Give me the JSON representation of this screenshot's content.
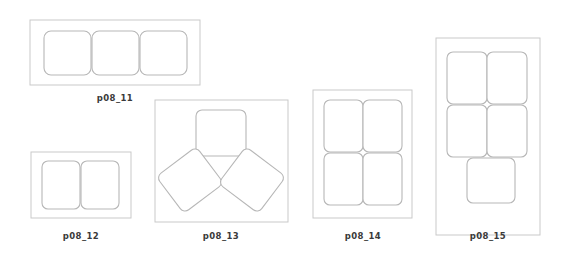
{
  "page": {
    "background_color": "#ffffff",
    "width": 574,
    "height": 255
  },
  "style": {
    "frame_stroke_color": "#c9c9c9",
    "piece_stroke_color": "#b7b7b7",
    "piece_fill_color": "#ffffff",
    "caption_color": "#3a3a3a"
  },
  "figures": [
    {
      "id": "p08_11",
      "label": "p08_11",
      "caption_x": 115,
      "caption_y": 101,
      "frame": {
        "x": 30,
        "y": 20,
        "w": 170,
        "h": 65
      },
      "piece_count": 3,
      "arrangement": "row-of-3",
      "pieces": [
        {
          "x": 44,
          "y": 31,
          "w": 47,
          "h": 44,
          "r": 7,
          "rotate": 0
        },
        {
          "x": 92,
          "y": 31,
          "w": 47,
          "h": 44,
          "r": 7,
          "rotate": 0
        },
        {
          "x": 140,
          "y": 31,
          "w": 47,
          "h": 44,
          "r": 7,
          "rotate": 0
        }
      ]
    },
    {
      "id": "p08_12",
      "label": "p08_12",
      "caption_x": 81,
      "caption_y": 239,
      "frame": {
        "x": 31,
        "y": 152,
        "w": 100,
        "h": 66
      },
      "piece_count": 2,
      "arrangement": "row-of-2",
      "pieces": [
        {
          "x": 42,
          "y": 161,
          "w": 38,
          "h": 48,
          "r": 6,
          "rotate": 0
        },
        {
          "x": 81,
          "y": 161,
          "w": 38,
          "h": 48,
          "r": 6,
          "rotate": 0
        }
      ]
    },
    {
      "id": "p08_13",
      "label": "p08_13",
      "caption_x": 221,
      "caption_y": 239,
      "frame": {
        "x": 155,
        "y": 100,
        "w": 133,
        "h": 122
      },
      "piece_count": 3,
      "arrangement": "fan-of-3",
      "pieces": [
        {
          "x": 196,
          "y": 110,
          "w": 50,
          "h": 46,
          "r": 6,
          "rotate": 0,
          "cx": 221,
          "cy": 133
        },
        {
          "x": 165,
          "y": 157,
          "w": 50,
          "h": 46,
          "r": 6,
          "rotate": -37,
          "cx": 190,
          "cy": 180
        },
        {
          "x": 227,
          "y": 157,
          "w": 50,
          "h": 46,
          "r": 6,
          "rotate": 37,
          "cx": 252,
          "cy": 180
        }
      ]
    },
    {
      "id": "p08_14",
      "label": "p08_14",
      "caption_x": 363,
      "caption_y": 239,
      "frame": {
        "x": 313,
        "y": 90,
        "w": 99,
        "h": 128
      },
      "piece_count": 4,
      "arrangement": "grid-2x2",
      "pieces": [
        {
          "x": 324,
          "y": 100,
          "w": 39,
          "h": 52,
          "r": 6,
          "rotate": 0
        },
        {
          "x": 363,
          "y": 100,
          "w": 39,
          "h": 52,
          "r": 6,
          "rotate": 0
        },
        {
          "x": 324,
          "y": 153,
          "w": 39,
          "h": 52,
          "r": 6,
          "rotate": 0
        },
        {
          "x": 363,
          "y": 153,
          "w": 39,
          "h": 52,
          "r": 6,
          "rotate": 0
        }
      ]
    },
    {
      "id": "p08_15",
      "label": "p08_15",
      "caption_x": 488,
      "caption_y": 239,
      "frame": {
        "x": 436,
        "y": 38,
        "w": 104,
        "h": 197
      },
      "piece_count": 5,
      "arrangement": "grid-2x2-plus-1",
      "pieces": [
        {
          "x": 447,
          "y": 52,
          "w": 40,
          "h": 52,
          "r": 6,
          "rotate": 0
        },
        {
          "x": 487,
          "y": 52,
          "w": 40,
          "h": 52,
          "r": 6,
          "rotate": 0
        },
        {
          "x": 447,
          "y": 105,
          "w": 40,
          "h": 52,
          "r": 6,
          "rotate": 0
        },
        {
          "x": 487,
          "y": 105,
          "w": 40,
          "h": 52,
          "r": 6,
          "rotate": 0
        },
        {
          "x": 467,
          "y": 158,
          "w": 48,
          "h": 45,
          "r": 6,
          "rotate": 0
        }
      ]
    }
  ]
}
